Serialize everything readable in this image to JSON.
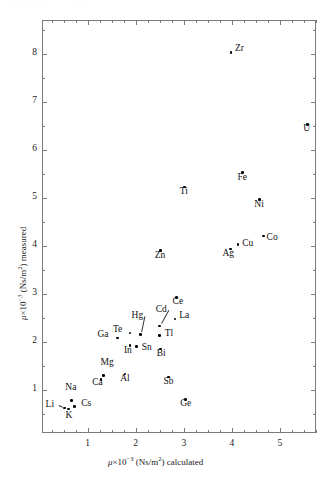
{
  "figure": {
    "top_scan_text": "· · ·  · ·    ·  ·   ·    · ·",
    "background": "#ffffff",
    "marker_color": "#000000",
    "axis_color": "#7a7a7a"
  },
  "chart_data": {
    "type": "scatter",
    "title": "",
    "xlabel": "μ×10⁻³ (Ns/m²) calculated",
    "ylabel": "μ×10⁻³ (Ns/m²) measured",
    "xlim": [
      0.05,
      5.75
    ],
    "ylim": [
      0.1,
      8.7
    ],
    "xticks": [
      1,
      2,
      3,
      4,
      5
    ],
    "yticks": [
      1,
      2,
      3,
      4,
      5,
      6,
      7,
      8
    ],
    "xminor_step": 0.25,
    "yminor_step": 0.5,
    "grid": false,
    "legend": "none",
    "point_label_field": "element",
    "points": [
      {
        "element": "Li",
        "x": 0.52,
        "y": 0.62,
        "lx": -19,
        "ly": -4,
        "leader": true
      },
      {
        "element": "Na",
        "x": 0.66,
        "y": 0.78,
        "lx": -6,
        "ly": -13
      },
      {
        "element": "K",
        "x": 0.6,
        "y": 0.6,
        "lx": -3,
        "ly": 6
      },
      {
        "element": "Cs",
        "x": 0.72,
        "y": 0.65,
        "lx": 7,
        "ly": -4
      },
      {
        "element": "Ca",
        "x": 1.28,
        "y": 1.22,
        "lx": -9,
        "ly": 3
      },
      {
        "element": "Mg",
        "x": 1.33,
        "y": 1.3,
        "lx": -3,
        "ly": -13
      },
      {
        "element": "Al",
        "x": 1.78,
        "y": 1.33,
        "lx": -5,
        "ly": 4
      },
      {
        "element": "Ga",
        "x": 1.62,
        "y": 2.08,
        "lx": -20,
        "ly": -4
      },
      {
        "element": "Te",
        "x": 1.88,
        "y": 2.18,
        "lx": -17,
        "ly": -4
      },
      {
        "element": "In",
        "x": 1.88,
        "y": 1.92,
        "lx": -6,
        "ly": 4
      },
      {
        "element": "Sn",
        "x": 2.02,
        "y": 1.9,
        "lx": 5,
        "ly": 0
      },
      {
        "element": "Hg",
        "x": 2.1,
        "y": 2.15,
        "lx": -9,
        "ly": -20,
        "leader": true
      },
      {
        "element": "Cd",
        "x": 2.5,
        "y": 2.33,
        "lx": -4,
        "ly": -17,
        "leader": true
      },
      {
        "element": "Bi",
        "x": 2.52,
        "y": 1.85,
        "lx": -4,
        "ly": 4
      },
      {
        "element": "Tl",
        "x": 2.5,
        "y": 2.13,
        "lx": 5,
        "ly": -3
      },
      {
        "element": "Sb",
        "x": 2.68,
        "y": 1.27,
        "lx": -5,
        "ly": 4
      },
      {
        "element": "Ge",
        "x": 3.03,
        "y": 0.8,
        "lx": -5,
        "ly": 4
      },
      {
        "element": "La",
        "x": 2.82,
        "y": 2.47,
        "lx": 4,
        "ly": -4
      },
      {
        "element": "Ce",
        "x": 2.85,
        "y": 2.92,
        "lx": -4,
        "ly": 3
      },
      {
        "element": "Zn",
        "x": 2.52,
        "y": 3.9,
        "lx": -6,
        "ly": 4
      },
      {
        "element": "Ti",
        "x": 3.02,
        "y": 5.22,
        "lx": -5,
        "ly": 4
      },
      {
        "element": "Ag",
        "x": 3.97,
        "y": 3.93,
        "lx": -8,
        "ly": 4
      },
      {
        "element": "Cu",
        "x": 4.13,
        "y": 4.02,
        "lx": 4,
        "ly": -2
      },
      {
        "element": "Co",
        "x": 4.66,
        "y": 4.2,
        "lx": 3,
        "ly": 1
      },
      {
        "element": "Ni",
        "x": 4.57,
        "y": 4.96,
        "lx": -5,
        "ly": 4
      },
      {
        "element": "Fe",
        "x": 4.22,
        "y": 5.52,
        "lx": -5,
        "ly": 4
      },
      {
        "element": "Zr",
        "x": 3.98,
        "y": 8.02,
        "lx": 4,
        "ly": -5
      },
      {
        "element": "U",
        "x": 5.57,
        "y": 6.53,
        "lx": -4,
        "ly": 4
      }
    ]
  }
}
